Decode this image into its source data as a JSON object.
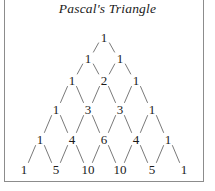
{
  "figure": {
    "title": "Pascal's Triangle",
    "background_color": "#ffffff",
    "text_color": "#1a1a1a",
    "line_color": "#7a7a7a",
    "frame_color": "#8c8c8c"
  },
  "diagram": {
    "type": "pascals-triangle",
    "rows_shown": 6,
    "row_values": [
      [
        1
      ],
      [
        1,
        1
      ],
      [
        1,
        2,
        1
      ],
      [
        1,
        3,
        3,
        1
      ],
      [
        1,
        4,
        6,
        4,
        1
      ],
      [
        1,
        5,
        10,
        10,
        5,
        1
      ]
    ],
    "nodes": [
      {
        "row": 0,
        "index": 0,
        "label": "1",
        "x": 104,
        "y": 37
      },
      {
        "row": 1,
        "index": 0,
        "label": "1",
        "x": 88,
        "y": 58
      },
      {
        "row": 1,
        "index": 1,
        "label": "1",
        "x": 120,
        "y": 58
      },
      {
        "row": 2,
        "index": 0,
        "label": "1",
        "x": 72,
        "y": 80
      },
      {
        "row": 2,
        "index": 1,
        "label": "2",
        "x": 104,
        "y": 80
      },
      {
        "row": 2,
        "index": 2,
        "label": "1",
        "x": 136,
        "y": 80
      },
      {
        "row": 3,
        "index": 0,
        "label": "1",
        "x": 56,
        "y": 109
      },
      {
        "row": 3,
        "index": 1,
        "label": "3",
        "x": 88,
        "y": 109
      },
      {
        "row": 3,
        "index": 2,
        "label": "3",
        "x": 120,
        "y": 109
      },
      {
        "row": 3,
        "index": 3,
        "label": "1",
        "x": 152,
        "y": 109
      },
      {
        "row": 4,
        "index": 0,
        "label": "1",
        "x": 40,
        "y": 139
      },
      {
        "row": 4,
        "index": 1,
        "label": "4",
        "x": 72,
        "y": 139
      },
      {
        "row": 4,
        "index": 2,
        "label": "6",
        "x": 104,
        "y": 139
      },
      {
        "row": 4,
        "index": 3,
        "label": "4",
        "x": 136,
        "y": 139
      },
      {
        "row": 4,
        "index": 4,
        "label": "1",
        "x": 168,
        "y": 139
      },
      {
        "row": 5,
        "index": 0,
        "label": "1",
        "x": 24,
        "y": 169
      },
      {
        "row": 5,
        "index": 1,
        "label": "5",
        "x": 56,
        "y": 169
      },
      {
        "row": 5,
        "index": 2,
        "label": "10",
        "x": 88,
        "y": 169
      },
      {
        "row": 5,
        "index": 3,
        "label": "10",
        "x": 120,
        "y": 169
      },
      {
        "row": 5,
        "index": 4,
        "label": "5",
        "x": 152,
        "y": 169
      },
      {
        "row": 5,
        "index": 5,
        "label": "1",
        "x": 184,
        "y": 169
      }
    ]
  }
}
